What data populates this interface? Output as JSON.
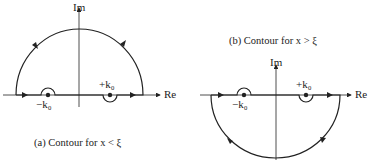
{
  "panel_a": {
    "caption": "(a) Contour for x < ξ",
    "axis_im": "Im",
    "axis_re": "Re",
    "pole_neg": "−k₀",
    "pole_pos": "+k₀",
    "contour": "upper half-plane semicircle, counterclockwise"
  },
  "panel_b": {
    "caption": "(b) Contour for x > ξ",
    "axis_im": "Im",
    "axis_re": "Re",
    "pole_neg": "−k₀",
    "pole_pos": "+k₀",
    "contour": "lower half-plane semicircle, clockwise"
  }
}
